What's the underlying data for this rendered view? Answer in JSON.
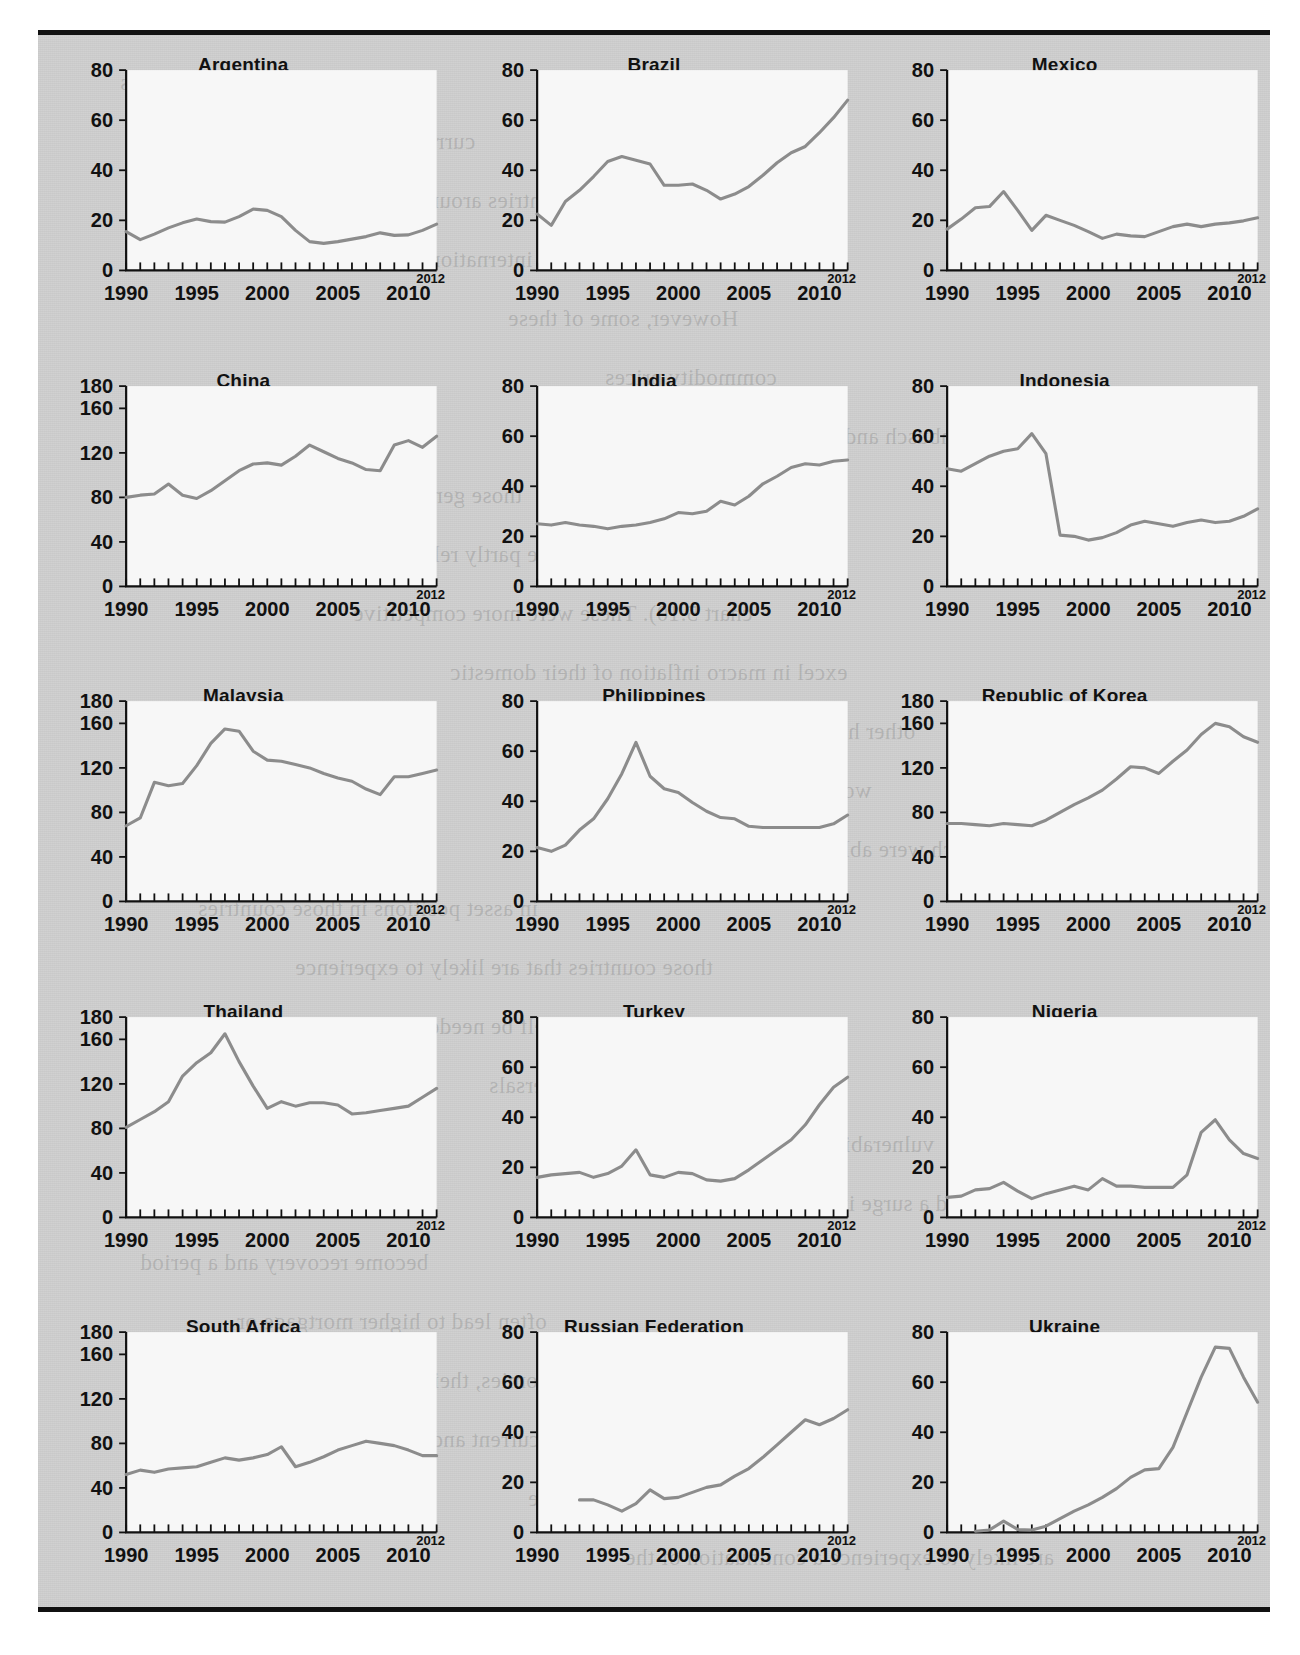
{
  "figure": {
    "background_color": "#cfcfcf",
    "plot_background_color": "#f7f7f7",
    "line_color": "#8c8c8c",
    "axis_color": "#111111",
    "rule_color": "#111111",
    "layout": {
      "rows": 5,
      "cols": 3
    },
    "end_label": "2012"
  },
  "bleed_text": [
    "the developing economies",
    "currencies were influenced",
    "countries around the rise in",
    "also the sharp decline in international",
    "However, some of these",
    "commodity prices",
    "Using the Dornbusch and Fischer model",
    "those general and credit in the current",
    "crises, which may be partly related to overvalued",
    "chart 5.10). These were more competitive",
    "excel in macro inflation of their domestic",
    "other hand the stock of capital inflows",
    "world financial markets",
    "in some countries which were able to attract",
    "in asset positions in those countries",
    "those countries that are likely to experience",
    "reform would not itself be needed to",
    "of payments problems. The reversals",
    "vulnerability due to a larger stock in",
    "inflows and a surge in domestic credit",
    "become recovery and a period",
    "often lead to higher mortgage or",
    "open economies, their might be",
    "flows as a current and",
    "example, the sole amount of the",
    "are likely to experience a continuation of the"
  ],
  "chart_data": [
    {
      "type": "line",
      "title": "Argentina",
      "xlabel": "",
      "ylabel": "",
      "xlim": [
        1990,
        2012
      ],
      "ylim": [
        0,
        80
      ],
      "yticks": [
        0,
        20,
        40,
        60,
        80
      ],
      "xticks": [
        1990,
        1995,
        2000,
        2005,
        2010
      ],
      "grid": false,
      "legend": "none",
      "x": [
        1990,
        1991,
        1992,
        1993,
        1994,
        1995,
        1996,
        1997,
        1998,
        1999,
        2000,
        2001,
        2002,
        2003,
        2004,
        2005,
        2006,
        2007,
        2008,
        2009,
        2010,
        2011,
        2012
      ],
      "values": [
        15.5,
        12.3,
        14.5,
        17.0,
        19.0,
        20.5,
        19.5,
        19.3,
        21.5,
        24.5,
        24.0,
        21.5,
        16.0,
        11.5,
        10.8,
        11.5,
        12.5,
        13.5,
        15.0,
        14.0,
        14.2,
        16.0,
        18.5
      ]
    },
    {
      "type": "line",
      "title": "Brazil",
      "xlabel": "",
      "ylabel": "",
      "xlim": [
        1990,
        2012
      ],
      "ylim": [
        0,
        80
      ],
      "yticks": [
        0,
        20,
        40,
        60,
        80
      ],
      "xticks": [
        1990,
        1995,
        2000,
        2005,
        2010
      ],
      "grid": false,
      "legend": "none",
      "x": [
        1990,
        1991,
        1992,
        1993,
        1994,
        1995,
        1996,
        1997,
        1998,
        1999,
        2000,
        2001,
        2002,
        2003,
        2004,
        2005,
        2006,
        2007,
        2008,
        2009,
        2010,
        2011,
        2012
      ],
      "values": [
        22.5,
        18.0,
        27.5,
        32.0,
        37.5,
        43.5,
        45.5,
        44.0,
        42.5,
        34.0,
        34.0,
        34.5,
        32.0,
        28.5,
        30.5,
        33.5,
        38.0,
        43.0,
        47.0,
        49.5,
        55.0,
        61.0,
        68.0
      ]
    },
    {
      "type": "line",
      "title": "Mexico",
      "xlabel": "",
      "ylabel": "",
      "xlim": [
        1990,
        2012
      ],
      "ylim": [
        0,
        80
      ],
      "yticks": [
        0,
        20,
        40,
        60,
        80
      ],
      "xticks": [
        1990,
        1995,
        2000,
        2005,
        2010
      ],
      "grid": false,
      "legend": "none",
      "x": [
        1990,
        1991,
        1992,
        1993,
        1994,
        1995,
        1996,
        1997,
        1998,
        1999,
        2000,
        2001,
        2002,
        2003,
        2004,
        2005,
        2006,
        2007,
        2008,
        2009,
        2010,
        2011,
        2012
      ],
      "values": [
        16.5,
        20.5,
        25.0,
        25.5,
        31.5,
        24.0,
        16.0,
        22.0,
        20.0,
        18.0,
        15.5,
        12.8,
        14.5,
        13.8,
        13.5,
        15.5,
        17.5,
        18.5,
        17.5,
        18.5,
        19.0,
        19.8,
        21.0
      ]
    },
    {
      "type": "line",
      "title": "China",
      "xlabel": "",
      "ylabel": "",
      "xlim": [
        1990,
        2012
      ],
      "ylim": [
        0,
        180
      ],
      "yticks": [
        0,
        40,
        80,
        120,
        160,
        180
      ],
      "xticks": [
        1990,
        1995,
        2000,
        2005,
        2010
      ],
      "grid": false,
      "legend": "none",
      "x": [
        1990,
        1991,
        1992,
        1993,
        1994,
        1995,
        1996,
        1997,
        1998,
        1999,
        2000,
        2001,
        2002,
        2003,
        2004,
        2005,
        2006,
        2007,
        2008,
        2009,
        2010,
        2011,
        2012
      ],
      "values": [
        80,
        82,
        83,
        92,
        82,
        79,
        86,
        95,
        104,
        110,
        111,
        109,
        117,
        127,
        121,
        115,
        111,
        105,
        104,
        127,
        131,
        125,
        135
      ]
    },
    {
      "type": "line",
      "title": "India",
      "xlabel": "",
      "ylabel": "",
      "xlim": [
        1990,
        2012
      ],
      "ylim": [
        0,
        80
      ],
      "yticks": [
        0,
        20,
        40,
        60,
        80
      ],
      "xticks": [
        1990,
        1995,
        2000,
        2005,
        2010
      ],
      "grid": false,
      "legend": "none",
      "x": [
        1990,
        1991,
        1992,
        1993,
        1994,
        1995,
        1996,
        1997,
        1998,
        1999,
        2000,
        2001,
        2002,
        2003,
        2004,
        2005,
        2006,
        2007,
        2008,
        2009,
        2010,
        2011,
        2012
      ],
      "values": [
        25,
        24.5,
        25.5,
        24.5,
        24,
        23,
        24,
        24.5,
        25.5,
        27,
        29.5,
        29,
        30,
        34,
        32.5,
        36,
        41,
        44,
        47.5,
        49,
        48.5,
        50,
        50.5
      ]
    },
    {
      "type": "line",
      "title": "Indonesia",
      "xlabel": "",
      "ylabel": "",
      "xlim": [
        1990,
        2012
      ],
      "ylim": [
        0,
        80
      ],
      "yticks": [
        0,
        20,
        40,
        60,
        80
      ],
      "xticks": [
        1990,
        1995,
        2000,
        2005,
        2010
      ],
      "grid": false,
      "legend": "none",
      "x": [
        1990,
        1991,
        1992,
        1993,
        1994,
        1995,
        1996,
        1997,
        1998,
        1999,
        2000,
        2001,
        2002,
        2003,
        2004,
        2005,
        2006,
        2007,
        2008,
        2009,
        2010,
        2011,
        2012
      ],
      "values": [
        47,
        46,
        49,
        52,
        54,
        55,
        61,
        53,
        20.5,
        20,
        18.5,
        19.5,
        21.5,
        24.5,
        26,
        25,
        24,
        25.5,
        26.5,
        25.5,
        26,
        28,
        31
      ]
    },
    {
      "type": "line",
      "title": "Malaysia",
      "xlabel": "",
      "ylabel": "",
      "xlim": [
        1990,
        2012
      ],
      "ylim": [
        0,
        180
      ],
      "yticks": [
        0,
        40,
        80,
        120,
        160,
        180
      ],
      "xticks": [
        1990,
        1995,
        2000,
        2005,
        2010
      ],
      "grid": false,
      "legend": "none",
      "x": [
        1990,
        1991,
        1992,
        1993,
        1994,
        1995,
        1996,
        1997,
        1998,
        1999,
        2000,
        2001,
        2002,
        2003,
        2004,
        2005,
        2006,
        2007,
        2008,
        2009,
        2010,
        2011,
        2012
      ],
      "values": [
        68,
        75,
        107,
        104,
        106,
        122,
        142,
        155,
        153,
        135,
        127,
        126,
        123,
        120,
        115,
        111,
        108,
        101,
        96,
        112,
        112,
        115,
        118
      ]
    },
    {
      "type": "line",
      "title": "Philippines",
      "xlabel": "",
      "ylabel": "",
      "xlim": [
        1990,
        2012
      ],
      "ylim": [
        0,
        80
      ],
      "yticks": [
        0,
        20,
        40,
        60,
        80
      ],
      "xticks": [
        1990,
        1995,
        2000,
        2005,
        2010
      ],
      "grid": false,
      "legend": "none",
      "x": [
        1990,
        1991,
        1992,
        1993,
        1994,
        1995,
        1996,
        1997,
        1998,
        1999,
        2000,
        2001,
        2002,
        2003,
        2004,
        2005,
        2006,
        2007,
        2008,
        2009,
        2010,
        2011,
        2012
      ],
      "values": [
        21.5,
        20,
        22.5,
        28.5,
        33,
        41,
        51,
        63.5,
        50,
        45,
        43.5,
        39.5,
        36,
        33.5,
        33,
        30,
        29.5,
        29.5,
        29.5,
        29.5,
        29.5,
        31,
        34.5
      ]
    },
    {
      "type": "line",
      "title": "Republic of Korea",
      "xlabel": "",
      "ylabel": "",
      "xlim": [
        1990,
        2012
      ],
      "ylim": [
        0,
        180
      ],
      "yticks": [
        0,
        40,
        80,
        120,
        160,
        180
      ],
      "xticks": [
        1990,
        1995,
        2000,
        2005,
        2010
      ],
      "grid": false,
      "legend": "none",
      "x": [
        1990,
        1991,
        1992,
        1993,
        1994,
        1995,
        1996,
        1997,
        1998,
        1999,
        2000,
        2001,
        2002,
        2003,
        2004,
        2005,
        2006,
        2007,
        2008,
        2009,
        2010,
        2011,
        2012
      ],
      "values": [
        70,
        70,
        69,
        68,
        70,
        69,
        68,
        73,
        80,
        87,
        93,
        100,
        110,
        121,
        120,
        115,
        126,
        136,
        150,
        160,
        157,
        148,
        143
      ]
    },
    {
      "type": "line",
      "title": "Thailand",
      "xlabel": "",
      "ylabel": "",
      "xlim": [
        1990,
        2012
      ],
      "ylim": [
        0,
        180
      ],
      "yticks": [
        0,
        40,
        80,
        120,
        160,
        180
      ],
      "xticks": [
        1990,
        1995,
        2000,
        2005,
        2010
      ],
      "grid": false,
      "legend": "none",
      "x": [
        1990,
        1991,
        1992,
        1993,
        1994,
        1995,
        1996,
        1997,
        1998,
        1999,
        2000,
        2001,
        2002,
        2003,
        2004,
        2005,
        2006,
        2007,
        2008,
        2009,
        2010,
        2011,
        2012
      ],
      "values": [
        81,
        88,
        95,
        104,
        127,
        139,
        148,
        165,
        140,
        118,
        98,
        104,
        100,
        103,
        103,
        101,
        93,
        94,
        96,
        98,
        100,
        108,
        116
      ]
    },
    {
      "type": "line",
      "title": "Turkey",
      "xlabel": "",
      "ylabel": "",
      "xlim": [
        1990,
        2012
      ],
      "ylim": [
        0,
        80
      ],
      "yticks": [
        0,
        20,
        40,
        60,
        80
      ],
      "xticks": [
        1990,
        1995,
        2000,
        2005,
        2010
      ],
      "grid": false,
      "legend": "none",
      "x": [
        1990,
        1991,
        1992,
        1993,
        1994,
        1995,
        1996,
        1997,
        1998,
        1999,
        2000,
        2001,
        2002,
        2003,
        2004,
        2005,
        2006,
        2007,
        2008,
        2009,
        2010,
        2011,
        2012
      ],
      "values": [
        16,
        17,
        17.5,
        18,
        16,
        17.5,
        20.5,
        27,
        17,
        16,
        18,
        17.5,
        15,
        14.5,
        15.5,
        19,
        23,
        27,
        31,
        37,
        45,
        52,
        56
      ]
    },
    {
      "type": "line",
      "title": "Nigeria",
      "xlabel": "",
      "ylabel": "",
      "xlim": [
        1990,
        2012
      ],
      "ylim": [
        0,
        80
      ],
      "yticks": [
        0,
        20,
        40,
        60,
        80
      ],
      "xticks": [
        1990,
        1995,
        2000,
        2005,
        2010
      ],
      "grid": false,
      "legend": "none",
      "x": [
        1990,
        1991,
        1992,
        1993,
        1994,
        1995,
        1996,
        1997,
        1998,
        1999,
        2000,
        2001,
        2002,
        2003,
        2004,
        2005,
        2006,
        2007,
        2008,
        2009,
        2010,
        2011,
        2012
      ],
      "values": [
        8,
        8.5,
        11,
        11.5,
        14,
        10.5,
        7.5,
        9.5,
        11,
        12.5,
        11,
        15.5,
        12.5,
        12.5,
        12,
        12,
        12,
        17,
        34,
        39,
        31,
        25.5,
        23.5
      ]
    },
    {
      "type": "line",
      "title": "South Africa",
      "xlabel": "",
      "ylabel": "",
      "xlim": [
        1990,
        2012
      ],
      "ylim": [
        0,
        180
      ],
      "yticks": [
        0,
        40,
        80,
        120,
        160,
        180
      ],
      "xticks": [
        1990,
        1995,
        2000,
        2005,
        2010
      ],
      "grid": false,
      "legend": "none",
      "x": [
        1990,
        1991,
        1992,
        1993,
        1994,
        1995,
        1996,
        1997,
        1998,
        1999,
        2000,
        2001,
        2002,
        2003,
        2004,
        2005,
        2006,
        2007,
        2008,
        2009,
        2010,
        2011,
        2012
      ],
      "values": [
        52,
        56,
        54,
        57,
        58,
        59,
        63,
        67,
        65,
        67,
        70,
        77,
        59,
        63,
        68,
        74,
        78,
        82,
        80,
        78,
        74,
        69,
        69
      ]
    },
    {
      "type": "line",
      "title": "Russian Federation",
      "xlabel": "",
      "ylabel": "",
      "xlim": [
        1990,
        2012
      ],
      "ylim": [
        0,
        80
      ],
      "yticks": [
        0,
        20,
        40,
        60,
        80
      ],
      "xticks": [
        1990,
        1995,
        2000,
        2005,
        2010
      ],
      "grid": false,
      "legend": "none",
      "x": [
        1993,
        1994,
        1995,
        1996,
        1997,
        1998,
        1999,
        2000,
        2001,
        2002,
        2003,
        2004,
        2005,
        2006,
        2007,
        2008,
        2009,
        2010,
        2011,
        2012
      ],
      "values": [
        13,
        13,
        11,
        8.5,
        11.5,
        17,
        13.5,
        14,
        16,
        18,
        19,
        22.5,
        25.5,
        30,
        35,
        40,
        45,
        43,
        45.5,
        49
      ]
    },
    {
      "type": "line",
      "title": "Ukraine",
      "xlabel": "",
      "ylabel": "",
      "xlim": [
        1990,
        2012
      ],
      "ylim": [
        0,
        80
      ],
      "yticks": [
        0,
        20,
        40,
        60,
        80
      ],
      "xticks": [
        1990,
        1995,
        2000,
        2005,
        2010
      ],
      "grid": false,
      "legend": "none",
      "x": [
        1992,
        1993,
        1994,
        1995,
        1996,
        1997,
        1998,
        1999,
        2000,
        2001,
        2002,
        2003,
        2004,
        2005,
        2006,
        2007,
        2008,
        2009,
        2010,
        2011,
        2012
      ],
      "values": [
        0.5,
        1.0,
        4.5,
        1.2,
        1.0,
        2.5,
        5.5,
        8.5,
        11,
        14,
        17.5,
        22,
        25,
        25.5,
        34,
        48,
        62,
        74,
        73.5,
        62,
        52
      ]
    }
  ]
}
